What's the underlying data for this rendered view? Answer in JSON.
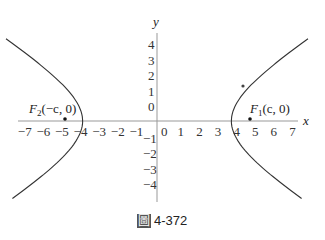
{
  "chart_data": {
    "type": "line",
    "title": "",
    "caption": "圖 4-372",
    "xlabel": "x",
    "ylabel": "y",
    "xlim": [
      -7.5,
      7.5
    ],
    "ylim": [
      -4.5,
      5
    ],
    "x_ticks": [
      -7,
      -6,
      -5,
      -4,
      -3,
      -2,
      -1,
      0,
      1,
      2,
      3,
      4,
      5,
      6,
      7
    ],
    "y_ticks": [
      -4,
      -3,
      -2,
      -1,
      0,
      1,
      2,
      3,
      4
    ],
    "grid": false,
    "series": [
      {
        "name": "hyperbola right branch",
        "equation": "x^2/16 - y^2/9 = 1",
        "vertex": [
          4,
          0
        ]
      },
      {
        "name": "hyperbola left branch",
        "equation": "x^2/16 - y^2/9 = 1",
        "vertex": [
          -4,
          0
        ]
      }
    ],
    "points": [
      {
        "label": "F1(c, 0)",
        "x": 5,
        "y": 0
      },
      {
        "label": "F2(−c, 0)",
        "x": -5,
        "y": 0
      },
      {
        "label": "point on curve",
        "x": 4.6,
        "y": 2.3
      }
    ],
    "annotations": [
      "F1(c, 0)",
      "F2(−c, 0)"
    ]
  },
  "labels": {
    "x_axis": "x",
    "y_axis": "y",
    "f1_main": "F",
    "f1_sub": "1",
    "f1_rest": "(c, 0)",
    "f2_main": "F",
    "f2_sub": "2",
    "f2_rest": "(−c, 0)",
    "caption_mark": "圖",
    "caption_text": "4-372"
  }
}
